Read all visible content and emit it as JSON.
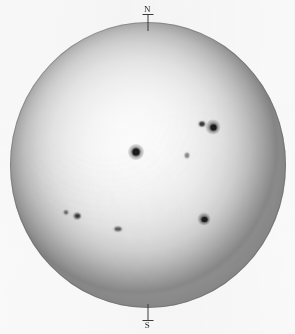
{
  "image": {
    "subject": "solar-disk-photograph",
    "title": "White-light photograph of the solar disk with sunspots",
    "background_color": "#fdfdfd",
    "disk": {
      "center_x": 148,
      "center_y": 165,
      "radius_x": 138,
      "radius_y": 143,
      "center_color": "#fcfcfc",
      "limb_color": "#888888",
      "limb_darkening": true
    }
  },
  "orientation_marks": [
    {
      "name": "north",
      "label": "N",
      "position": "top",
      "tick_color": "#3a3a3a"
    },
    {
      "name": "south",
      "label": "S",
      "position": "bottom",
      "tick_color": "#3a3a3a"
    }
  ],
  "sunspots": [
    {
      "id": "spot-central",
      "label": "central large spot",
      "x": 136,
      "y": 152,
      "penumbra_diameter": 15,
      "umbra_diameter": 7,
      "darkness": "dark"
    },
    {
      "id": "spot-ne-large",
      "label": "north-east large spot",
      "x": 213,
      "y": 127,
      "penumbra_diameter": 14,
      "umbra_diameter": 6,
      "darkness": "dark"
    },
    {
      "id": "spot-ne-small",
      "label": "north-east companion spot",
      "x": 202,
      "y": 124,
      "penumbra_diameter": 7,
      "umbra_diameter": 4,
      "darkness": "medium"
    },
    {
      "id": "spot-se",
      "label": "south-east spot",
      "x": 204,
      "y": 219,
      "penumbra_diameter": 12,
      "umbra_diameter": 6,
      "darkness": "dark"
    },
    {
      "id": "spot-sw-a",
      "label": "south-west spot",
      "x": 77,
      "y": 216,
      "penumbra_diameter": 8,
      "umbra_diameter": 4,
      "darkness": "medium"
    },
    {
      "id": "spot-sw-b",
      "label": "south-west faint spot",
      "x": 66,
      "y": 212,
      "penumbra_diameter": 5,
      "umbra_diameter": 2,
      "darkness": "faint"
    },
    {
      "id": "spot-s-group",
      "label": "southern faint spot group",
      "x": 118,
      "y": 229,
      "penumbra_diameter": 9,
      "umbra_diameter": 3,
      "darkness": "faint"
    },
    {
      "id": "spot-centre-faint",
      "label": "faint pore near centre",
      "x": 187,
      "y": 155,
      "penumbra_diameter": 5,
      "umbra_diameter": 2,
      "darkness": "very-faint"
    }
  ]
}
